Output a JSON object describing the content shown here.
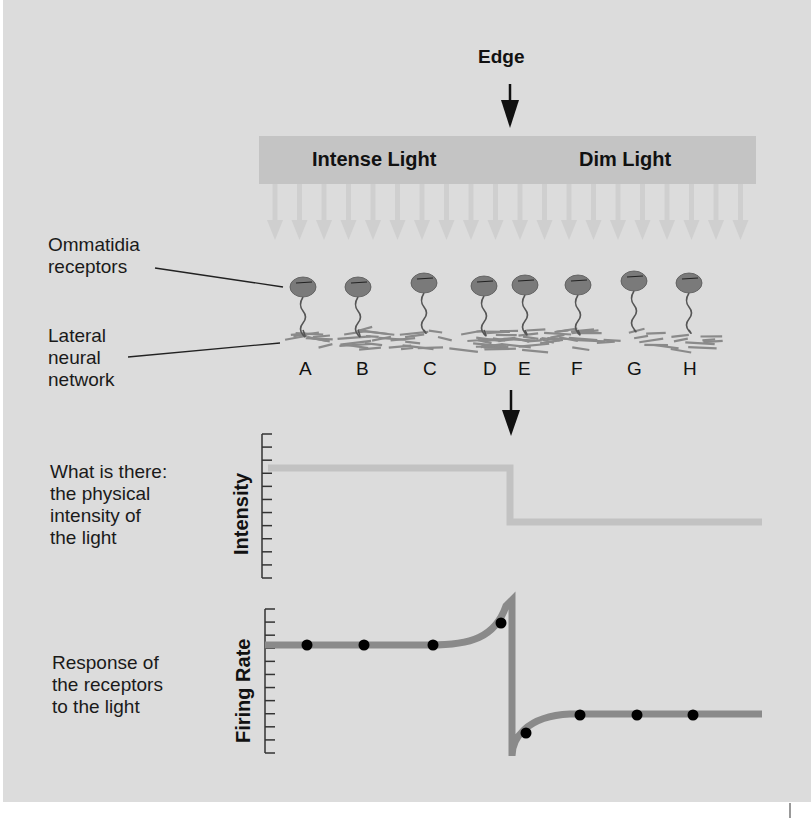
{
  "header": {
    "edge_label": "Edge"
  },
  "light_bar": {
    "left_label": "Intense Light",
    "right_label": "Dim Light",
    "arrow_count": 20
  },
  "labels": {
    "ommatidia_line1": "Ommatidia",
    "ommatidia_line2": "receptors",
    "lateral_line1": "Lateral",
    "lateral_line2": "neural",
    "lateral_line3": "network"
  },
  "receptors": [
    "A",
    "B",
    "C",
    "D",
    "E",
    "F",
    "G",
    "H"
  ],
  "intensity_panel": {
    "desc_line1": "What is there:",
    "desc_line2": "the physical",
    "desc_line3": "intensity of",
    "desc_line4": "the light",
    "axis_label": "Intensity"
  },
  "firing_panel": {
    "desc_line1": "Response of",
    "desc_line2": "the receptors",
    "desc_line3": "to the light",
    "axis_label": "Firing Rate"
  },
  "colors": {
    "background": "#dcdcdc",
    "light_bar": "#c4c4c4",
    "intensity_line": "#c2c2c2",
    "firing_line": "#8a8a8a",
    "receptor": "#7a7a7a",
    "dots": "#000000"
  },
  "chart_data": [
    {
      "type": "line",
      "title": "What is there: the physical intensity of the light",
      "ylabel": "Intensity",
      "xlabel": "",
      "description": "Step function: high intensity on the left (intense light), drops sharply at the edge to a low level (dim light)",
      "x": [
        "A",
        "B",
        "C",
        "D",
        "Edge",
        "E",
        "F",
        "G",
        "H"
      ],
      "y_ticks": 12,
      "values_left": 8,
      "values_right": 3,
      "ylim": [
        0,
        11
      ]
    },
    {
      "type": "line",
      "title": "Response of the receptors to the light",
      "ylabel": "Firing Rate",
      "xlabel": "",
      "description": "Firing rate flat on intense side, rises just before the edge (receptor D), drops sharply below baseline just after the edge (receptor E), then recovers to a lower steady level",
      "categories": [
        "A",
        "B",
        "C",
        "D",
        "E",
        "F",
        "G",
        "H"
      ],
      "values": [
        9,
        9,
        9,
        10.8,
        0.8,
        3,
        3,
        3
      ],
      "y_ticks": 12,
      "ylim": [
        0,
        11
      ]
    }
  ]
}
